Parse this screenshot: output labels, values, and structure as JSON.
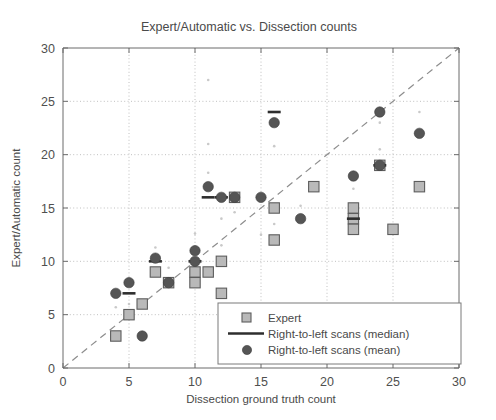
{
  "chart_data": {
    "type": "scatter",
    "title": "Expert/Automatic vs. Dissection counts",
    "xlabel": "Dissection ground truth count",
    "ylabel": "Expert/Automatic count",
    "xlim": [
      0,
      30
    ],
    "ylim": [
      0,
      30
    ],
    "xticks": [
      0,
      5,
      10,
      15,
      20,
      25,
      30
    ],
    "yticks": [
      0,
      5,
      10,
      15,
      20,
      25,
      30
    ],
    "xticklabels": [
      "0",
      "5",
      "10",
      "15",
      "20",
      "25",
      "30"
    ],
    "yticklabels": [
      "0",
      "5",
      "10",
      "15",
      "20",
      "25",
      "30"
    ],
    "grid": true,
    "legend_position": "lower right",
    "annotations": [
      "dashed identity line y = x"
    ],
    "series": [
      {
        "name": "Expert",
        "marker": "square",
        "color": "#b9b9b9",
        "points": [
          [
            4,
            3
          ],
          [
            5,
            5
          ],
          [
            6,
            6
          ],
          [
            7,
            9
          ],
          [
            8,
            8
          ],
          [
            10,
            9
          ],
          [
            10,
            8
          ],
          [
            11,
            9
          ],
          [
            12,
            10
          ],
          [
            12,
            7
          ],
          [
            13,
            16
          ],
          [
            16,
            15
          ],
          [
            16,
            12
          ],
          [
            19,
            17
          ],
          [
            22,
            15
          ],
          [
            22,
            14
          ],
          [
            22,
            13
          ],
          [
            24,
            19
          ],
          [
            25,
            13
          ],
          [
            27,
            17
          ]
        ]
      },
      {
        "name": "Right-to-left scans (median)",
        "marker": "line",
        "color": "#2e2e2e",
        "points": [
          [
            5,
            7
          ],
          [
            7,
            10
          ],
          [
            10,
            10
          ],
          [
            11,
            16
          ],
          [
            12,
            16
          ],
          [
            16,
            24
          ],
          [
            22,
            14
          ],
          [
            24,
            19
          ]
        ]
      },
      {
        "name": "Right-to-left scans (mean)",
        "marker": "circle",
        "color": "#555555",
        "points": [
          [
            4,
            7
          ],
          [
            5,
            8
          ],
          [
            6,
            3
          ],
          [
            7,
            10.3
          ],
          [
            8,
            8
          ],
          [
            10,
            11
          ],
          [
            10,
            10
          ],
          [
            11,
            17
          ],
          [
            12,
            16
          ],
          [
            13,
            16
          ],
          [
            15,
            16
          ],
          [
            16,
            23
          ],
          [
            18,
            14
          ],
          [
            22,
            18
          ],
          [
            24,
            24
          ],
          [
            24,
            19
          ],
          [
            27,
            22
          ]
        ]
      }
    ],
    "scatter_noise": [
      [
        5,
        6
      ],
      [
        7,
        11.3
      ],
      [
        10,
        12.6
      ],
      [
        11,
        18.3
      ],
      [
        11,
        21
      ],
      [
        11,
        27
      ],
      [
        12,
        14
      ],
      [
        13,
        14.6
      ],
      [
        15,
        12.5
      ],
      [
        16,
        13.5
      ],
      [
        16,
        20.8
      ],
      [
        18,
        15.2
      ],
      [
        22,
        16.8
      ],
      [
        24,
        23
      ],
      [
        24,
        20.5
      ],
      [
        27,
        24
      ],
      [
        4,
        5.7
      ],
      [
        8,
        9.4
      ],
      [
        12,
        11.5
      ]
    ]
  },
  "legend": {
    "entries": [
      {
        "label": "Expert",
        "marker": "square"
      },
      {
        "label": "Right-to-left scans (median)",
        "marker": "line"
      },
      {
        "label": "Right-to-left scans (mean)",
        "marker": "circle"
      }
    ]
  }
}
